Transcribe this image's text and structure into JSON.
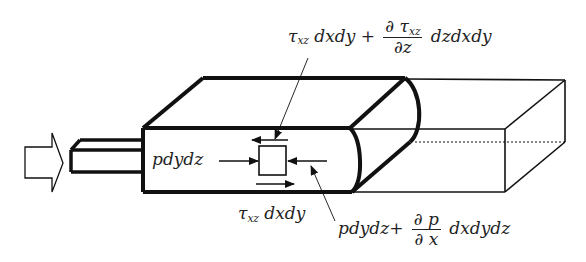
{
  "diagram": {
    "labels": {
      "shear_top": {
        "tau": "τ",
        "sub": "xz",
        "term1": " dxdy + ",
        "frac_num_d": "∂",
        "frac_num_tau": "τ",
        "frac_num_sub": "xz",
        "frac_den": "∂z",
        "term2": " dzdxdy"
      },
      "pressure_left": "pdydz",
      "shear_bottom": {
        "tau": "τ",
        "sub": "xz",
        "term": " dxdy"
      },
      "pressure_right": {
        "term1": "pdydz+ ",
        "frac_num": "∂ p",
        "frac_den": "∂ x",
        "term2": " dxdydz"
      }
    },
    "elements": {
      "inflow_arrow": "hollow-right-arrow",
      "nozzle": "rectangular-inlet",
      "control_volume": "bold-rounded-slab",
      "outer_channel": "thin-rectangular-box",
      "fluid_element": "small-square"
    },
    "colors": {
      "stroke": "#111111",
      "background": "#ffffff",
      "text": "#222222"
    }
  }
}
